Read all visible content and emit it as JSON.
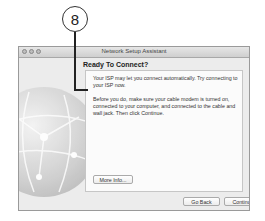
{
  "callout": {
    "number": "8"
  },
  "window": {
    "title": "Network Setup Assistant",
    "heading": "Ready To Connect?",
    "paragraph1": "Your ISP may let you connect automatically. Try connecting to your ISP now.",
    "paragraph2": "Before you do, make sure your cable modem is turned on, connected to your computer, and connected to the cable and wall jack. Then click Continue.",
    "more_info_label": "More Info...",
    "go_back_label": "Go Back",
    "continue_label": "Continue"
  }
}
